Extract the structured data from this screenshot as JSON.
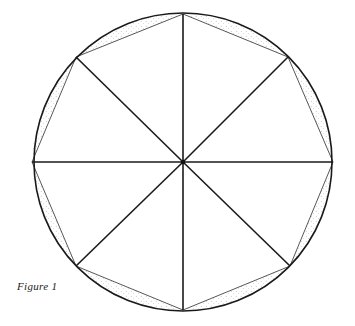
{
  "caption": "Figure 1",
  "diagram": {
    "type": "inscribed-octagon",
    "center": [
      183,
      162
    ],
    "radius": 149,
    "sides": 8,
    "vertices": [
      [
        183,
        14
      ],
      [
        288,
        57
      ],
      [
        333,
        162
      ],
      [
        290,
        266
      ],
      [
        183,
        310
      ],
      [
        76,
        266
      ],
      [
        32,
        162
      ],
      [
        76,
        57
      ]
    ],
    "colors": {
      "stroke": "#1a1a1a",
      "chord": "#444444",
      "stipple": "#888888",
      "background": "#ffffff"
    }
  }
}
